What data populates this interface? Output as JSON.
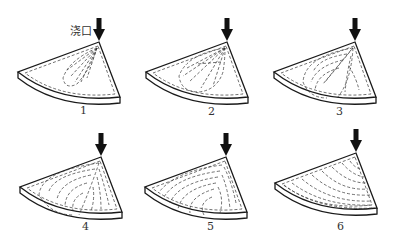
{
  "figure": {
    "gate_label": "浇口",
    "panels": [
      {
        "number": "1",
        "stage": "initial jet fill near gate",
        "apex": [
          99,
          42
        ],
        "label_pos": [
          80,
          104
        ]
      },
      {
        "number": "2",
        "stage": "fan-shaped spreading",
        "apex": [
          227,
          42
        ],
        "label_pos": [
          208,
          105
        ]
      },
      {
        "number": "3",
        "stage": "lobes forming around jet",
        "apex": [
          355,
          42
        ],
        "label_pos": [
          336,
          105
        ]
      },
      {
        "number": "4",
        "stage": "two lobes filling cavity",
        "apex": [
          101,
          157
        ],
        "label_pos": [
          82,
          220
        ]
      },
      {
        "number": "5",
        "stage": "arc-shaped layered fill",
        "apex": [
          226,
          157
        ],
        "label_pos": [
          207,
          220
        ]
      },
      {
        "number": "6",
        "stage": "cavity nearly full, concentric arcs",
        "apex": [
          356,
          153
        ],
        "label_pos": [
          337,
          220
        ]
      }
    ],
    "colors": {
      "line": "#1a1a1a",
      "dash": "#333333",
      "arrow": "#111111"
    }
  }
}
